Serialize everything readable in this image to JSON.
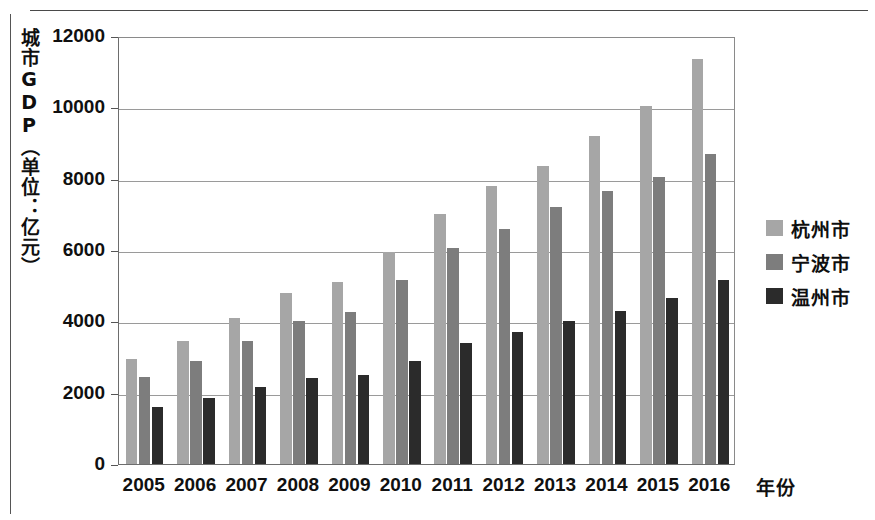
{
  "chart_data": {
    "type": "bar",
    "title": "",
    "xlabel": "年份",
    "ylabel": "城市GDP（单位：亿元）",
    "categories": [
      "2005",
      "2006",
      "2007",
      "2008",
      "2009",
      "2010",
      "2011",
      "2012",
      "2013",
      "2014",
      "2015",
      "2016"
    ],
    "series": [
      {
        "name": "杭州市",
        "color": "#a6a6a6",
        "values": [
          2950,
          3450,
          4100,
          4800,
          5100,
          5950,
          7000,
          7800,
          8350,
          9200,
          10050,
          11350
        ]
      },
      {
        "name": "宁波市",
        "color": "#7d7d7d",
        "values": [
          2450,
          2900,
          3450,
          4000,
          4250,
          5150,
          6050,
          6600,
          7200,
          7650,
          8050,
          8700
        ]
      },
      {
        "name": "温州市",
        "color": "#2b2b2b",
        "values": [
          1600,
          1850,
          2150,
          2400,
          2500,
          2900,
          3400,
          3700,
          4000,
          4300,
          4650,
          5150
        ]
      }
    ],
    "ylim": [
      0,
      12000
    ],
    "yticks": [
      0,
      2000,
      4000,
      6000,
      8000,
      10000,
      12000
    ],
    "ytick_labels": [
      "0",
      "2000",
      "4000",
      "6000",
      "8000",
      "10000",
      "12000"
    ],
    "grid": true,
    "legend_position": "right"
  },
  "legend": {
    "entries": [
      "杭州市",
      "宁波市",
      "温州市"
    ]
  },
  "axes": {
    "y_title": "城市GDP（单位：亿元）",
    "x_title": "年份"
  }
}
